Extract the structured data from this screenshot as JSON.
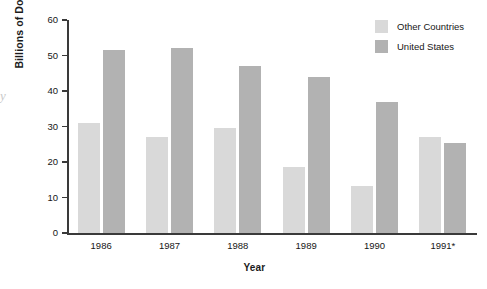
{
  "chart_data": {
    "type": "bar",
    "title": "",
    "xlabel": "Year",
    "ylabel": "Billions of Dollars",
    "categories": [
      "1986",
      "1987",
      "1988",
      "1989",
      "1990",
      "1991*"
    ],
    "series": [
      {
        "name": "Other Countries",
        "color": "#d9d9d9",
        "values": [
          31,
          27,
          29.5,
          18.7,
          13.3,
          27
        ]
      },
      {
        "name": "United States",
        "color": "#b2b2b2",
        "values": [
          51.5,
          52,
          47,
          44,
          37,
          25.3
        ]
      }
    ],
    "ylim": [
      0,
      60
    ],
    "yticks": [
      0,
      10,
      20,
      30,
      40,
      50,
      60
    ],
    "ytick_labels": [
      "0",
      "10",
      "20",
      "30",
      "40",
      "50",
      "60"
    ],
    "grid": false,
    "legend_position": "top-right"
  },
  "axes": {
    "y_title": "Billions of Dollars",
    "x_title": "Year"
  },
  "legend": {
    "items": [
      {
        "label": "Other Countries",
        "color": "#d9d9d9"
      },
      {
        "label": "United States",
        "color": "#b2b2b2"
      }
    ]
  },
  "artifact": {
    "glyph": "y"
  }
}
